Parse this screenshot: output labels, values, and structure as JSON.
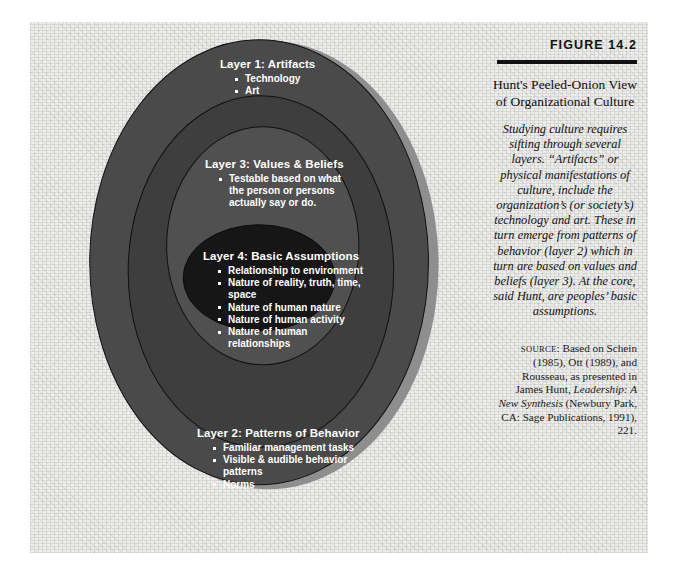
{
  "figure": {
    "number": "FIGURE 14.2",
    "title": "Hunt's Peeled-Onion View of Organizational Culture",
    "description": "Studying culture requires sifting through several layers. “Artifacts” or physical manifestations of culture, include the organization’s (or society’s) technology and art. These in turn emerge from patterns of behavior (layer 2) which in turn are based on values and beliefs (layer 3). At the core, said Hunt, are peoples’ basic assumptions.",
    "source_label": "SOURCE",
    "source_text_1": ": Based on Schein (1985), Ott (1989), and Rousseau, as presented in James Hunt, ",
    "source_italic": "Leadership: A New Synthesis",
    "source_text_2": " (Newbury Park, CA: Sage Publications, 1991), 221."
  },
  "diagram": {
    "type": "concentric-ellipses",
    "layers": [
      {
        "id": "layer1",
        "title": "Layer 1: Artifacts",
        "fill": "#4a4a4a",
        "items": [
          "Technology",
          "Art"
        ]
      },
      {
        "id": "layer2",
        "title": "Layer 2: Patterns of Behavior",
        "fill": "#3e3e3e",
        "items": [
          "Familiar management tasks",
          "Visible & audible behavior patterns",
          "Norms"
        ]
      },
      {
        "id": "layer3",
        "title": "Layer 3: Values & Beliefs",
        "fill": "#505050",
        "items": [
          "Testable based on what the person or persons actually say or do."
        ]
      },
      {
        "id": "layer4",
        "title": "Layer 4: Basic Assumptions",
        "fill": "#161616",
        "items": [
          "Relationship to environment",
          "Nature of reality, truth, time, space",
          "Nature of human nature",
          "Nature of human activity",
          "Nature of human relationships"
        ]
      }
    ],
    "colors": {
      "background": "#efefed",
      "shadow": "#8e8e8e",
      "outline": "#111111",
      "text": "#ffffff",
      "rule": "#111111"
    }
  }
}
